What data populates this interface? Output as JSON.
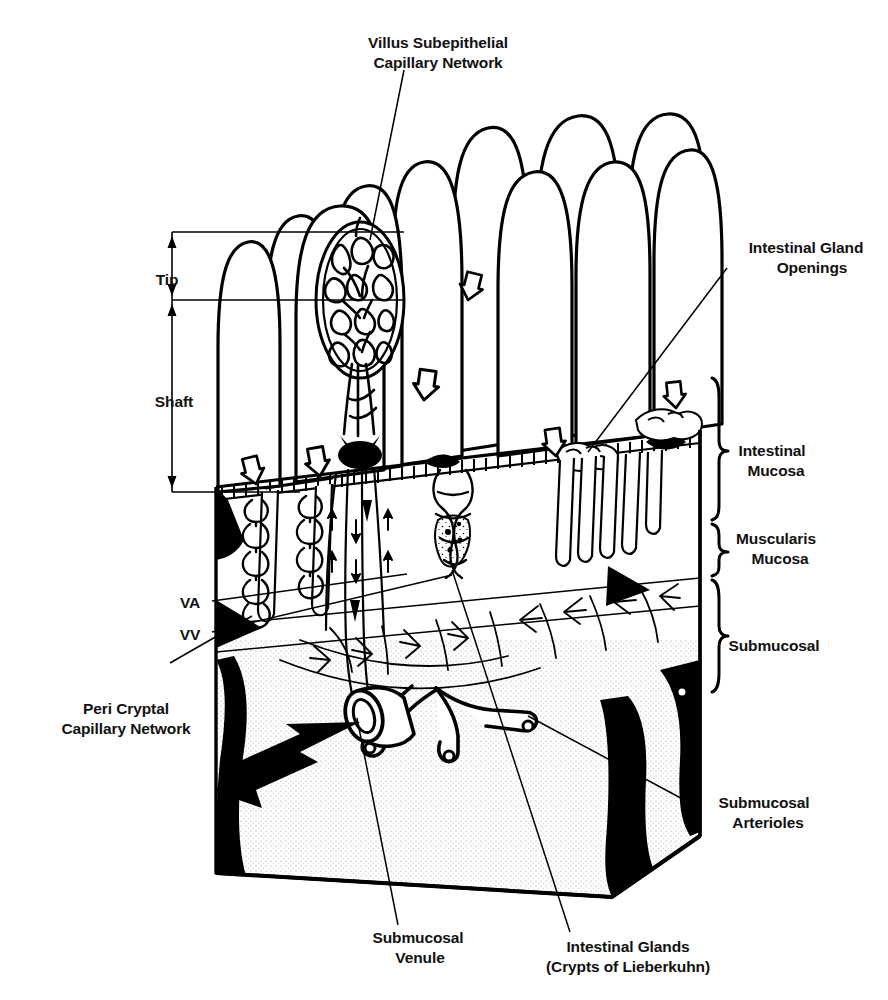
{
  "figure": {
    "style": "black-and-white line drawing",
    "ink_color": "#000000",
    "background_color": "#ffffff"
  },
  "labels": [
    {
      "id": "villus-subepithelial-capillary-network",
      "lines": [
        "Villus Subepithelial",
        "Capillary Network"
      ],
      "x": 438,
      "y": 33,
      "align": "center",
      "leader": {
        "from": [
          404,
          70
        ],
        "to": [
          370,
          240
        ]
      }
    },
    {
      "id": "intestinal-gland-openings",
      "lines": [
        "Intestinal Gland",
        "Openings"
      ],
      "x": 806,
      "y": 238,
      "align": "center",
      "leader": {
        "from": [
          727,
          268
        ],
        "to": [
          588,
          452
        ]
      }
    },
    {
      "id": "tip",
      "lines": [
        "Tip"
      ],
      "x": 167,
      "y": 270,
      "align": "center",
      "leader": null
    },
    {
      "id": "shaft",
      "lines": [
        "Shaft"
      ],
      "x": 174,
      "y": 392,
      "align": "center",
      "leader": null
    },
    {
      "id": "intestinal-mucosa",
      "lines": [
        "Intestinal",
        "Mucosa"
      ],
      "x": 772,
      "y": 451,
      "align": "center",
      "leader": null
    },
    {
      "id": "muscularis-mucosa",
      "lines": [
        "Muscularis",
        "Mucosa"
      ],
      "x": 776,
      "y": 539,
      "align": "center",
      "leader": null
    },
    {
      "id": "submucosal",
      "lines": [
        "Submucosal"
      ],
      "x": 774,
      "y": 636,
      "align": "center",
      "leader": null
    },
    {
      "id": "va",
      "lines": [
        "VA"
      ],
      "x": 190,
      "y": 593,
      "align": "center",
      "leader": {
        "from": [
          212,
          601
        ],
        "to": [
          407,
          574
        ]
      }
    },
    {
      "id": "vv",
      "lines": [
        "VV"
      ],
      "x": 190,
      "y": 625,
      "align": "center",
      "leader": {
        "from": [
          212,
          632
        ],
        "to": [
          452,
          575
        ]
      }
    },
    {
      "id": "peri-cryptal-capillary-network",
      "lines": [
        "Peri Cryptal",
        "Capillary Network"
      ],
      "x": 126,
      "y": 669,
      "align": "center",
      "leader": {
        "from": [
          170,
          663
        ],
        "to": [
          252,
          616
        ]
      }
    },
    {
      "id": "submucosal-arterioles",
      "lines": [
        "Submucosal",
        "Arterioles"
      ],
      "x": 764,
      "y": 793,
      "align": "center",
      "leader": {
        "from": [
          690,
          803
        ],
        "to": [
          528,
          716
        ]
      }
    },
    {
      "id": "submucosal-venule",
      "lines": [
        "Submucosal",
        "Venule"
      ],
      "x": 418,
      "y": 928,
      "align": "center",
      "leader": {
        "from": [
          398,
          925
        ],
        "to": [
          357,
          718
        ]
      }
    },
    {
      "id": "intestinal-glands-crypts-of-lieberkuhn",
      "lines": [
        "Intestinal Glands",
        "(Crypts of Lieberkuhn)"
      ],
      "x": 628,
      "y": 937,
      "align": "center",
      "leader": {
        "from": [
          570,
          932
        ],
        "to": [
          452,
          570
        ]
      }
    }
  ],
  "brackets": [
    {
      "id": "bracket-intestinal-mucosa",
      "x": 712,
      "y_top": 378,
      "y_bottom": 520
    },
    {
      "id": "bracket-muscularis-mucosa",
      "x": 712,
      "y_top": 524,
      "y_bottom": 576
    },
    {
      "id": "bracket-submucosal",
      "x": 712,
      "y_top": 580,
      "y_bottom": 692
    }
  ],
  "dimension_lines": {
    "id": "villus-height-dimension",
    "axis_x": 172,
    "tip_span": [
      232,
      300
    ],
    "shaft_span": [
      300,
      492
    ],
    "rule_lines": [
      {
        "y": 232,
        "x_from": 172,
        "x_to": 404
      },
      {
        "y": 300,
        "x_from": 172,
        "x_to": 404
      },
      {
        "y": 492,
        "x_from": 172,
        "x_to": 300
      }
    ]
  },
  "anatomy": {
    "villi_count": 12,
    "flow_arrows": "hollow chevron arrows over mucosal surface",
    "blood_flow_arrow": "solid black arrow exiting submucosal venule toward lower left"
  }
}
